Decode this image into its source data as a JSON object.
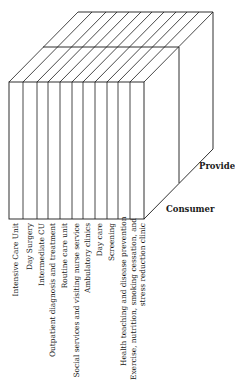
{
  "diagram": {
    "type": "3d-block",
    "axes": {
      "depth_front_label": "Consumer",
      "depth_back_label": "Provider"
    },
    "categories": [
      "Intensive Care Unit",
      "Day Surgery",
      "Intermediate CU",
      "Outpatient diagnosis and treatment",
      "Routine care unit",
      "Social services and visiting nurse service",
      "Ambulatory clinics",
      "Day care",
      "Screening",
      "Health teaching and disease prevention",
      "Exercise, nutrition, smoking cessation, and",
      "stress reduction clinic"
    ],
    "layers": [
      "Consumer",
      "Provider"
    ],
    "line_color": "#1a1a1a"
  }
}
